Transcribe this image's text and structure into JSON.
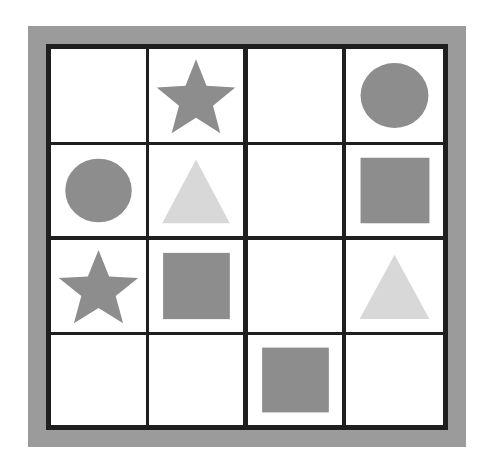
{
  "puzzle": {
    "colors": {
      "frame": "#9b9b9b",
      "grid_line": "#1f1f1f",
      "cell_bg": "#ffffff",
      "dark_shape": "#8d8d8d",
      "light_shape": "#d8d8d8"
    },
    "rows": 4,
    "cols": 4,
    "cells": [
      [
        {
          "shape": "empty"
        },
        {
          "shape": "star",
          "tone": "dark"
        },
        {
          "shape": "empty"
        },
        {
          "shape": "circle",
          "tone": "dark"
        }
      ],
      [
        {
          "shape": "circle",
          "tone": "dark"
        },
        {
          "shape": "triangle",
          "tone": "light"
        },
        {
          "shape": "empty"
        },
        {
          "shape": "square",
          "tone": "dark"
        }
      ],
      [
        {
          "shape": "star",
          "tone": "dark"
        },
        {
          "shape": "square",
          "tone": "dark"
        },
        {
          "shape": "empty"
        },
        {
          "shape": "triangle",
          "tone": "light"
        }
      ],
      [
        {
          "shape": "empty"
        },
        {
          "shape": "empty"
        },
        {
          "shape": "square",
          "tone": "dark"
        },
        {
          "shape": "empty"
        }
      ]
    ]
  }
}
